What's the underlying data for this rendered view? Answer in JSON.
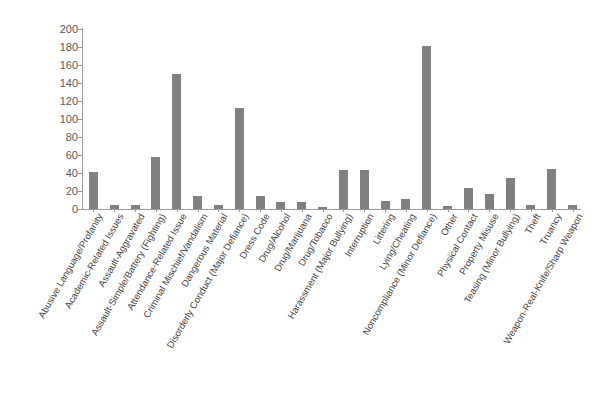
{
  "chart_data": {
    "type": "bar",
    "title": "",
    "subtitle": "",
    "xlabel": "",
    "ylabel": "",
    "ylim": [
      0,
      200
    ],
    "ytick_step": 20,
    "yticks": [
      0,
      20,
      40,
      60,
      80,
      100,
      120,
      140,
      160,
      180,
      200
    ],
    "grid": false,
    "legend": false,
    "legend_position": "none",
    "bar_color": "#808080",
    "axis_color": "#9a9a9a",
    "categories": [
      "Abusive Language/Profanity",
      "Academic-Related Issues",
      "Assault-Aggravated",
      "Assault-Simple/Battery (Fighting)",
      "Attendance-Related Issue",
      "Criminal Mischief/Vandalism",
      "Dangerous Material",
      "Disorderly Conduct (Major Defiance)",
      "Dress Code",
      "Drug/Alcohol",
      "Drug/Marijuana",
      "Drug/Tobacco",
      "Harassment (Major Bullying)",
      "Interruption",
      "Littering",
      "Lying/Cheating",
      "Noncompliance (Minor Defiance)",
      "Other",
      "Physical Contact",
      "Property Misuse",
      "Teasing (Minor Bullying)",
      "Theft",
      "Truancy",
      "Weapon-Real-Knife/Sharp Weapon"
    ],
    "values": [
      41,
      4,
      5,
      58,
      150,
      14,
      5,
      112,
      14,
      8,
      8,
      2,
      43,
      43,
      9,
      11,
      181,
      3,
      23,
      17,
      34,
      5,
      44,
      4
    ]
  },
  "axis": {
    "y_tick_labels": [
      "200",
      "180",
      "160",
      "140",
      "120",
      "100",
      "80",
      "60",
      "40",
      "20",
      "0"
    ]
  }
}
